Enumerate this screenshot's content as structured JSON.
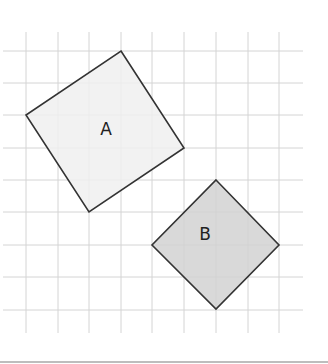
{
  "diagram": {
    "type": "grid-shapes",
    "grid": {
      "x_lines": [
        26,
        58,
        89,
        121,
        152,
        184,
        216,
        248,
        279
      ],
      "y_lines": [
        51,
        83,
        115,
        148,
        180,
        212,
        245,
        277,
        310
      ],
      "x_extent": [
        3,
        303
      ],
      "y_extent": [
        32,
        333
      ],
      "line_color": "#d4d4d4"
    },
    "shapes": [
      {
        "name": "A",
        "label": "A",
        "points": [
          [
            121,
            51
          ],
          [
            184,
            148
          ],
          [
            89,
            212
          ],
          [
            26,
            115
          ]
        ],
        "fill": "#f0f0f0",
        "stroke": "#333333",
        "label_pos": [
          106,
          130
        ]
      },
      {
        "name": "B",
        "label": "B",
        "points": [
          [
            216,
            180
          ],
          [
            279,
            245
          ],
          [
            216,
            309
          ],
          [
            152,
            245
          ]
        ],
        "fill": "#d2d2d2",
        "stroke": "#333333",
        "label_pos": [
          205,
          235
        ]
      }
    ]
  }
}
